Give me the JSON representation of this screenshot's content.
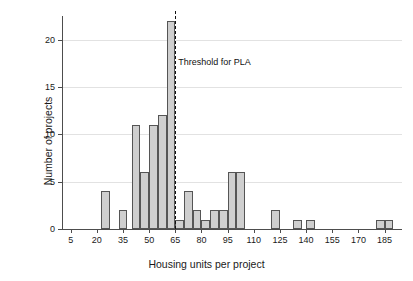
{
  "chart_data": {
    "type": "bar",
    "title": "",
    "subtitle": "",
    "xlabel": "Housing units per project",
    "ylabel": "Number of projects",
    "xlim": [
      0,
      195
    ],
    "ylim": [
      0,
      22.5
    ],
    "grid": "horizontal",
    "legend": "none",
    "bin_width": 5,
    "bar_color": "#cfcfcf",
    "bar_edge_color": "#555555",
    "x_ticks": [
      5,
      20,
      35,
      50,
      65,
      80,
      95,
      110,
      125,
      140,
      155,
      170,
      185
    ],
    "y_ticks": [
      0,
      5,
      10,
      15,
      20
    ],
    "bins": [
      {
        "left": 22.5,
        "right": 27.5,
        "center": 25,
        "count": 4
      },
      {
        "left": 32.5,
        "right": 37.5,
        "center": 35,
        "count": 2
      },
      {
        "left": 40.0,
        "right": 45.0,
        "center": 42.5,
        "count": 11
      },
      {
        "left": 45.0,
        "right": 50.0,
        "center": 47.5,
        "count": 6
      },
      {
        "left": 50.0,
        "right": 55.0,
        "center": 52.5,
        "count": 11
      },
      {
        "left": 55.0,
        "right": 60.0,
        "center": 57.5,
        "count": 12
      },
      {
        "left": 60.0,
        "right": 65.0,
        "center": 62.5,
        "count": 22
      },
      {
        "left": 65.0,
        "right": 70.0,
        "center": 67.5,
        "count": 1
      },
      {
        "left": 70.0,
        "right": 75.0,
        "center": 72.5,
        "count": 4
      },
      {
        "left": 75.0,
        "right": 80.0,
        "center": 77.5,
        "count": 2
      },
      {
        "left": 80.0,
        "right": 85.0,
        "center": 82.5,
        "count": 1
      },
      {
        "left": 85.0,
        "right": 90.0,
        "center": 87.5,
        "count": 2
      },
      {
        "left": 90.0,
        "right": 95.0,
        "center": 92.5,
        "count": 2
      },
      {
        "left": 95.0,
        "right": 100.0,
        "center": 97.5,
        "count": 6
      },
      {
        "left": 100.0,
        "right": 105.0,
        "center": 102.5,
        "count": 6
      },
      {
        "left": 120.0,
        "right": 125.0,
        "center": 122.5,
        "count": 2
      },
      {
        "left": 132.5,
        "right": 137.5,
        "center": 135,
        "count": 1
      },
      {
        "left": 140.0,
        "right": 145.0,
        "center": 142.5,
        "count": 1
      },
      {
        "left": 180.0,
        "right": 185.0,
        "center": 182.5,
        "count": 1
      },
      {
        "left": 185.0,
        "right": 190.0,
        "center": 187.5,
        "count": 1
      }
    ],
    "annotations": [
      {
        "name": "threshold",
        "label": "Threshold for PLA",
        "x": 65,
        "style": "dashed-vline",
        "color": "#111111"
      }
    ]
  }
}
